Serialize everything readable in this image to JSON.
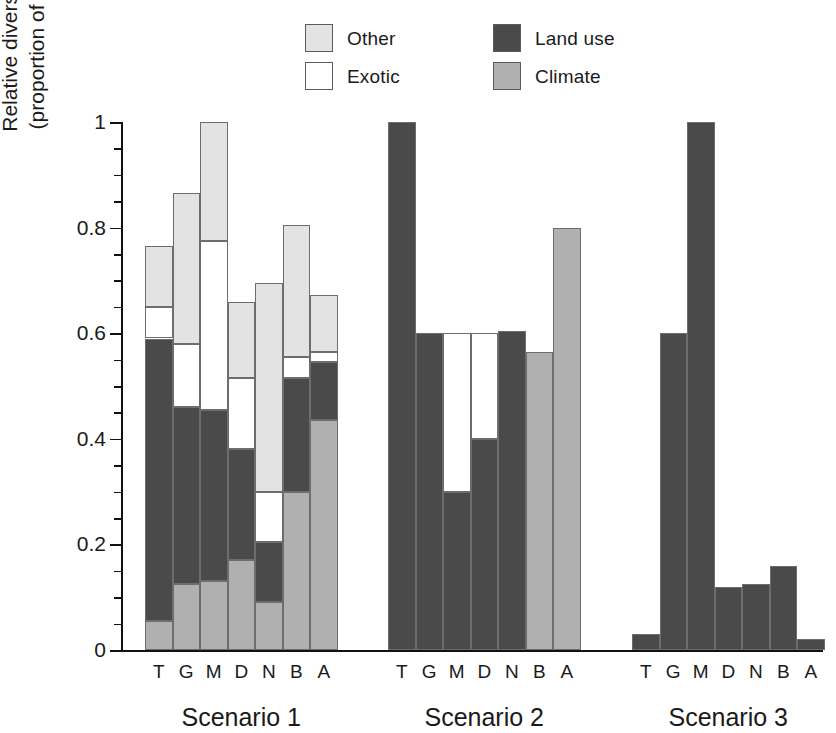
{
  "legend": {
    "items": [
      {
        "label": "Other",
        "color": "#e3e3e3",
        "key": "other"
      },
      {
        "label": "Exotic",
        "color": "#ffffff",
        "key": "exotic"
      },
      {
        "label": "Land use",
        "color": "#4a4a4a",
        "key": "landuse"
      },
      {
        "label": "Climate",
        "color": "#b0b0b0",
        "key": "climate"
      }
    ]
  },
  "axes": {
    "ylabel_line1": "Relative diversity change",
    "ylabel_line2": "(proportion of maximum)",
    "ytick_labels": [
      "0",
      "0.2",
      "0.4",
      "0.6",
      "0.8",
      "1"
    ],
    "ytick_values": [
      0,
      0.2,
      0.4,
      0.6,
      0.8,
      1
    ],
    "yminor_step": 0.05,
    "ylim": [
      0,
      1
    ]
  },
  "groups": [
    {
      "label": "Scenario 1"
    },
    {
      "label": "Scenario 2"
    },
    {
      "label": "Scenario 3"
    }
  ],
  "categories": [
    "T",
    "G",
    "M",
    "D",
    "N",
    "B",
    "A"
  ],
  "chart_data": {
    "type": "bar",
    "subtype": "stacked",
    "title": "",
    "xlabel": "",
    "ylabel": "Relative diversity change (proportion of maximum)",
    "ylim": [
      0,
      1
    ],
    "grid": false,
    "legend_position": "top-center",
    "group_labels": [
      "Scenario 1",
      "Scenario 2",
      "Scenario 3"
    ],
    "categories": [
      "T",
      "G",
      "M",
      "D",
      "N",
      "B",
      "A"
    ],
    "series_order": [
      "climate",
      "landuse",
      "exotic",
      "other"
    ],
    "series": [
      {
        "name": "Climate",
        "color": "#b0b0b0",
        "values": {
          "Scenario 1": [
            0.055,
            0.125,
            0.13,
            0.17,
            0.09,
            0.3,
            0.435
          ],
          "Scenario 2": [
            0,
            0,
            0,
            0,
            0,
            0.565,
            0.8
          ],
          "Scenario 3": [
            0,
            0,
            0,
            0,
            0,
            0,
            0
          ]
        }
      },
      {
        "name": "Land use",
        "color": "#4a4a4a",
        "values": {
          "Scenario 1": [
            0.535,
            0.335,
            0.325,
            0.21,
            0.115,
            0.215,
            0.11
          ],
          "Scenario 2": [
            1.0,
            0.6,
            0.3,
            0.4,
            0.605,
            0,
            0
          ],
          "Scenario 3": [
            0.03,
            0.6,
            1.0,
            0.12,
            0.125,
            0.16,
            0.02
          ]
        }
      },
      {
        "name": "Exotic",
        "color": "#ffffff",
        "values": {
          "Scenario 1": [
            0.06,
            0.12,
            0.32,
            0.135,
            0.095,
            0.04,
            0.02
          ],
          "Scenario 2": [
            0,
            0,
            0.3,
            0.2,
            0,
            0,
            0
          ],
          "Scenario 3": [
            0,
            0,
            0,
            0,
            0,
            0,
            0
          ]
        }
      },
      {
        "name": "Other",
        "color": "#e3e3e3",
        "values": {
          "Scenario 1": [
            0.115,
            0.285,
            0.225,
            0.145,
            0.395,
            0.25,
            0.107
          ],
          "Scenario 2": [
            0,
            0,
            0,
            0,
            0,
            0,
            0
          ],
          "Scenario 3": [
            0,
            0,
            0,
            0,
            0,
            0,
            0
          ]
        }
      }
    ],
    "totals": {
      "Scenario 1": [
        0.765,
        0.865,
        1.0,
        0.66,
        0.695,
        0.805,
        0.672
      ],
      "Scenario 2": [
        1.0,
        0.6,
        0.6,
        0.6,
        0.605,
        0.565,
        0.8
      ],
      "Scenario 3": [
        0.03,
        0.6,
        1.0,
        0.12,
        0.125,
        0.16,
        0.02
      ]
    }
  },
  "layout": {
    "group_x": [
      145,
      388,
      632
    ],
    "bar_width": 27.5,
    "bar_pitch": 27.5
  }
}
